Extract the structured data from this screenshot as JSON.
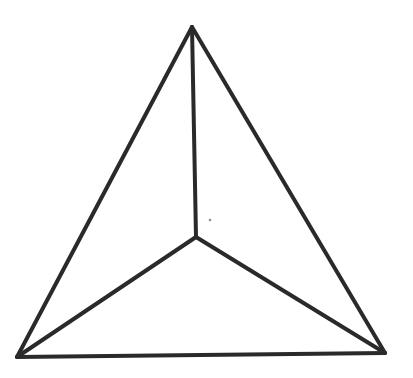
{
  "diagram": {
    "type": "hand-drawn tetrahedron (top view)",
    "stroke_color": "#2a2a2a",
    "background": "#ffffff",
    "vertices": {
      "top": [
        192,
        27
      ],
      "left": [
        17,
        357
      ],
      "right": [
        385,
        353
      ],
      "center": [
        196,
        237
      ]
    },
    "edges": [
      [
        "top",
        "left"
      ],
      [
        "top",
        "right"
      ],
      [
        "left",
        "right"
      ],
      [
        "top",
        "center"
      ],
      [
        "left",
        "center"
      ],
      [
        "right",
        "center"
      ]
    ],
    "marks": [
      {
        "type": "dot",
        "at": [
          210,
          220
        ]
      }
    ]
  }
}
